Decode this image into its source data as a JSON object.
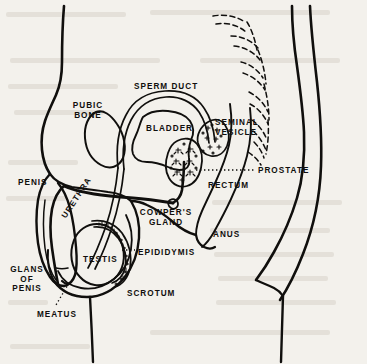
{
  "figure": {
    "type": "anatomical-line-diagram",
    "background_color": "#f3f1ec",
    "ink_color": "#100f0d",
    "width": 367,
    "height": 364
  },
  "labels": [
    {
      "id": "sperm-duct",
      "text": "SPERM DUCT",
      "x": 134,
      "y": 82,
      "align": "left",
      "rotation": 0
    },
    {
      "id": "pubic-bone",
      "text": "PUBIC\nBONE",
      "x": 88,
      "y": 101,
      "align": "center",
      "rotation": 0
    },
    {
      "id": "bladder",
      "text": "BLADDER",
      "x": 146,
      "y": 124,
      "align": "left",
      "rotation": 0
    },
    {
      "id": "seminal-vesicle",
      "text": "SEMINAL\nVESICLE",
      "x": 215,
      "y": 118,
      "align": "left",
      "rotation": 0
    },
    {
      "id": "prostate",
      "text": "PROSTATE",
      "x": 258,
      "y": 166,
      "align": "left",
      "rotation": 0
    },
    {
      "id": "rectum",
      "text": "RECTUM",
      "x": 208,
      "y": 181,
      "align": "left",
      "rotation": 0
    },
    {
      "id": "penis",
      "text": "PENIS",
      "x": 18,
      "y": 178,
      "align": "left",
      "rotation": 0
    },
    {
      "id": "urethra",
      "text": "URETHRA",
      "x": 60,
      "y": 215,
      "align": "left",
      "rotation": -57
    },
    {
      "id": "cowpers-gland",
      "text": "COWPER'S\nGLAND",
      "x": 166,
      "y": 208,
      "align": "center",
      "rotation": 0
    },
    {
      "id": "anus",
      "text": "ANUS",
      "x": 213,
      "y": 230,
      "align": "left",
      "rotation": 0
    },
    {
      "id": "epididymis",
      "text": "EPIDIDYMIS",
      "x": 138,
      "y": 248,
      "align": "left",
      "rotation": 0
    },
    {
      "id": "testis",
      "text": "TESTIS",
      "x": 83,
      "y": 255,
      "align": "left",
      "rotation": 0
    },
    {
      "id": "scrotum",
      "text": "SCROTUM",
      "x": 127,
      "y": 289,
      "align": "left",
      "rotation": 0
    },
    {
      "id": "glans-of-penis",
      "text": "GLANS\nOF\nPENIS",
      "x": 27,
      "y": 265,
      "align": "center",
      "rotation": 0
    },
    {
      "id": "meatus",
      "text": "MEATUS",
      "x": 37,
      "y": 310,
      "align": "left",
      "rotation": 0
    }
  ],
  "leader_lines": [
    {
      "id": "prostate-leader",
      "from": [
        196,
        170
      ],
      "to": [
        255,
        170
      ],
      "style": "dotted"
    },
    {
      "id": "epididymis-leader",
      "from": [
        122,
        250
      ],
      "to": [
        135,
        250
      ],
      "style": "dotted"
    },
    {
      "id": "meatus-leader",
      "from": [
        56,
        304
      ],
      "to": [
        69,
        283
      ],
      "style": "dotted"
    }
  ],
  "structures": [
    {
      "id": "body-outline",
      "label": "Abdominal and back body contour",
      "style": "solid-thick"
    },
    {
      "id": "sacrum-vertebrae",
      "label": "Sacrum and coccyx vertebrae",
      "style": "dashed"
    },
    {
      "id": "bladder-organ",
      "label": "Bladder",
      "style": "solid"
    },
    {
      "id": "prostate-organ",
      "label": "Prostate gland",
      "style": "stippled"
    },
    {
      "id": "seminal-vesicle-organ",
      "label": "Seminal vesicle",
      "style": "stippled"
    },
    {
      "id": "sperm-duct-tube",
      "label": "Vas deferens tube",
      "style": "double-line"
    },
    {
      "id": "testis-organ",
      "label": "Testis",
      "style": "solid"
    },
    {
      "id": "epididymis-organ",
      "label": "Epididymis",
      "style": "stippled"
    },
    {
      "id": "scrotum-organ",
      "label": "Scrotum",
      "style": "solid"
    },
    {
      "id": "penis-organ",
      "label": "Penis with urethra",
      "style": "solid"
    },
    {
      "id": "rectum-organ",
      "label": "Rectum and anus",
      "style": "solid"
    },
    {
      "id": "pubic-bone-organ",
      "label": "Pubic bone",
      "style": "solid"
    }
  ]
}
